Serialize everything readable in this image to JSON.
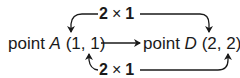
{
  "diagram": {
    "type": "point-transformation",
    "source": {
      "prefix": "point",
      "name": "A",
      "coords": "(1, 1)",
      "x": "1",
      "y": "1"
    },
    "target": {
      "prefix": "point",
      "name": "D",
      "coords": "(2, 2)",
      "x": "2",
      "y": "2"
    },
    "top_label": {
      "factor": "2",
      "times": "×",
      "value": "1"
    },
    "bottom_label": {
      "factor": "2",
      "times": "×",
      "value": "1"
    },
    "edges": [
      {
        "from": "A.x",
        "to": "D.x",
        "label": "2 × 1",
        "position": "top"
      },
      {
        "from": "A",
        "to": "D",
        "label": "",
        "position": "middle"
      },
      {
        "from": "A.y",
        "to": "D.y",
        "label": "2 × 1",
        "position": "bottom"
      }
    ],
    "colors": {
      "ink": "#1a1a1a",
      "background": "#ffffff"
    }
  }
}
